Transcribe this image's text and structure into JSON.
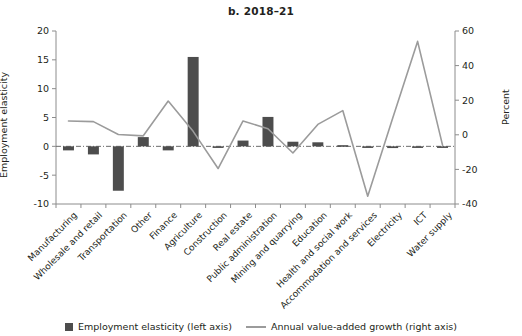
{
  "title": "b. 2018–21",
  "axes": {
    "left_label": "Employment elasticity",
    "right_label": "Percent",
    "left_ticks": [
      "20",
      "15",
      "10",
      "5",
      "0",
      "-5",
      "-10"
    ],
    "right_ticks": [
      "60",
      "40",
      "20",
      "0",
      "-20",
      "-40"
    ]
  },
  "legend": {
    "bar_label": "Employment elasticity (left axis)",
    "line_label": "Annual value-added growth (right axis)"
  },
  "colors": {
    "bar": "#4d4d4d",
    "line": "#9b9b9b",
    "axis": "#8c8c8c",
    "text": "#231f20"
  },
  "chart_data": {
    "type": "bar",
    "title": "b. 2018–21",
    "xlabel": "",
    "ylabel": "Employment elasticity",
    "y2label": "Percent",
    "ylim": [
      -10,
      20
    ],
    "y2lim": [
      -40,
      60
    ],
    "grid": false,
    "legend_position": "bottom",
    "categories": [
      "Manufacturing",
      "Wholesale and retail",
      "Transportation",
      "Other",
      "Finance",
      "Agriculture",
      "Construction",
      "Real estate",
      "Public administration",
      "Mining and quarrying",
      "Education",
      "Health and social work",
      "Accommodation and services",
      "Electricity",
      "ICT",
      "Water supply"
    ],
    "series": [
      {
        "name": "Employment elasticity (left axis)",
        "type": "bar",
        "axis": "left",
        "values": [
          -0.7,
          -1.4,
          -7.7,
          1.6,
          -0.7,
          15.5,
          -0.1,
          1.0,
          5.1,
          0.8,
          0.7,
          0.2,
          -0.1,
          -0.3,
          -0.1,
          -0.1
        ]
      },
      {
        "name": "Annual value-added growth (right axis)",
        "type": "line",
        "axis": "right",
        "values": [
          8.0,
          7.6,
          0.2,
          -0.6,
          19.5,
          2.0,
          -19.5,
          8.0,
          3.5,
          -10.5,
          6.0,
          14.0,
          -35.5,
          9.5,
          54.0,
          -6.0
        ]
      }
    ]
  }
}
